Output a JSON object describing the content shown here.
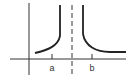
{
  "diagram": {
    "labels": {
      "a": "a",
      "b": "b"
    },
    "colors": {
      "stroke": "#333333",
      "background": "#ffffff"
    },
    "elements": [
      "y-axis",
      "x-axis",
      "vertical-asymptote-dashed",
      "left-branch-curve",
      "right-branch-curve",
      "tick-a",
      "tick-b"
    ]
  }
}
